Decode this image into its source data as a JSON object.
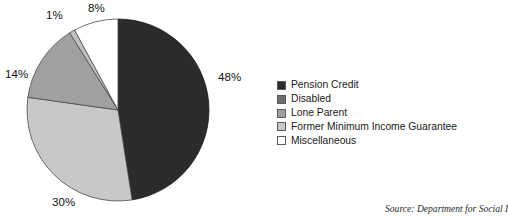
{
  "chart_data": {
    "type": "pie",
    "title": "",
    "subtitle": "",
    "xlabel": "",
    "ylabel": "",
    "legend_position": "right",
    "grid": false,
    "start_angle_deg": 0,
    "direction": "clockwise",
    "categories": [
      "Pension Credit",
      "Disabled",
      "Lone Parent",
      "Former Minimum Income Guarantee",
      "Miscellaneous"
    ],
    "values": [
      48,
      1,
      14,
      30,
      8
    ],
    "slice_order_clockwise": [
      "Pension Credit",
      "Former Minimum Income Guarantee",
      "Lone Parent",
      "Disabled",
      "Miscellaneous"
    ],
    "colors": [
      "#2b2b2b",
      "#6e6e6e",
      "#a0a0a0",
      "#c8c8c8",
      "#ffffff"
    ],
    "data_labels": [
      "48%",
      "30%",
      "14%",
      "1%",
      "8%"
    ],
    "annotations": [
      "Source: Department for Social I"
    ]
  },
  "pie": {
    "center_x": 118,
    "center_y": 110,
    "radius": 91,
    "slices": [
      {
        "name": "Pension Credit",
        "value": 48,
        "label": "48%",
        "color": "#2b2b2b",
        "stroke": "#1a1a1a",
        "label_x": 218,
        "label_y": 71
      },
      {
        "name": "Former Minimum Income Guarantee",
        "value": 30,
        "label": "30%",
        "color": "#c8c8c8",
        "stroke": "#4a4a4a",
        "label_x": 52,
        "label_y": 196
      },
      {
        "name": "Lone Parent",
        "value": 14,
        "label": "14%",
        "color": "#a0a0a0",
        "stroke": "#4a4a4a",
        "label_x": 5,
        "label_y": 68
      },
      {
        "name": "Disabled",
        "value": 1,
        "label": "1%",
        "color": "#c0c0c0",
        "stroke": "#4a4a4a",
        "label_x": 46,
        "label_y": 9
      },
      {
        "name": "Miscellaneous",
        "value": 8,
        "label": "8%",
        "color": "#ffffff",
        "stroke": "#4a4a4a",
        "label_x": 88,
        "label_y": 2
      }
    ]
  },
  "legend": {
    "items": [
      {
        "label": "Pension Credit",
        "color": "#2b2b2b"
      },
      {
        "label": "Disabled",
        "color": "#6e6e6e"
      },
      {
        "label": "Lone Parent",
        "color": "#a0a0a0"
      },
      {
        "label": "Former Minimum Income Guarantee",
        "color": "#c8c8c8"
      },
      {
        "label": "Miscellaneous",
        "color": "#ffffff"
      }
    ]
  },
  "footer": {
    "source": "Source: Department for Social I"
  }
}
